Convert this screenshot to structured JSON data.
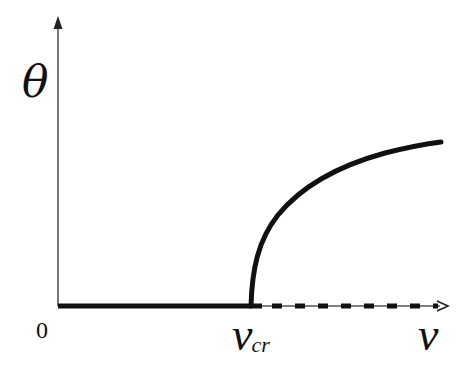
{
  "diagram": {
    "title": "",
    "axes": {
      "y_label": "θ",
      "x_label": "v",
      "origin_label": "0",
      "critical_label_main": "v",
      "critical_label_sub": "cr"
    },
    "branches": [
      {
        "name": "stable-zero-branch",
        "style": "solid-thick",
        "from": "0",
        "to": "v_cr"
      },
      {
        "name": "unstable-zero-branch",
        "style": "dashed",
        "from": "v_cr",
        "to": "v"
      },
      {
        "name": "nonzero-branch",
        "style": "solid-thick",
        "shape": "square-root",
        "from": "v_cr",
        "to": "beyond"
      }
    ],
    "colors": {
      "line": "#111111",
      "axis": "#555555",
      "background": "#ffffff"
    }
  }
}
